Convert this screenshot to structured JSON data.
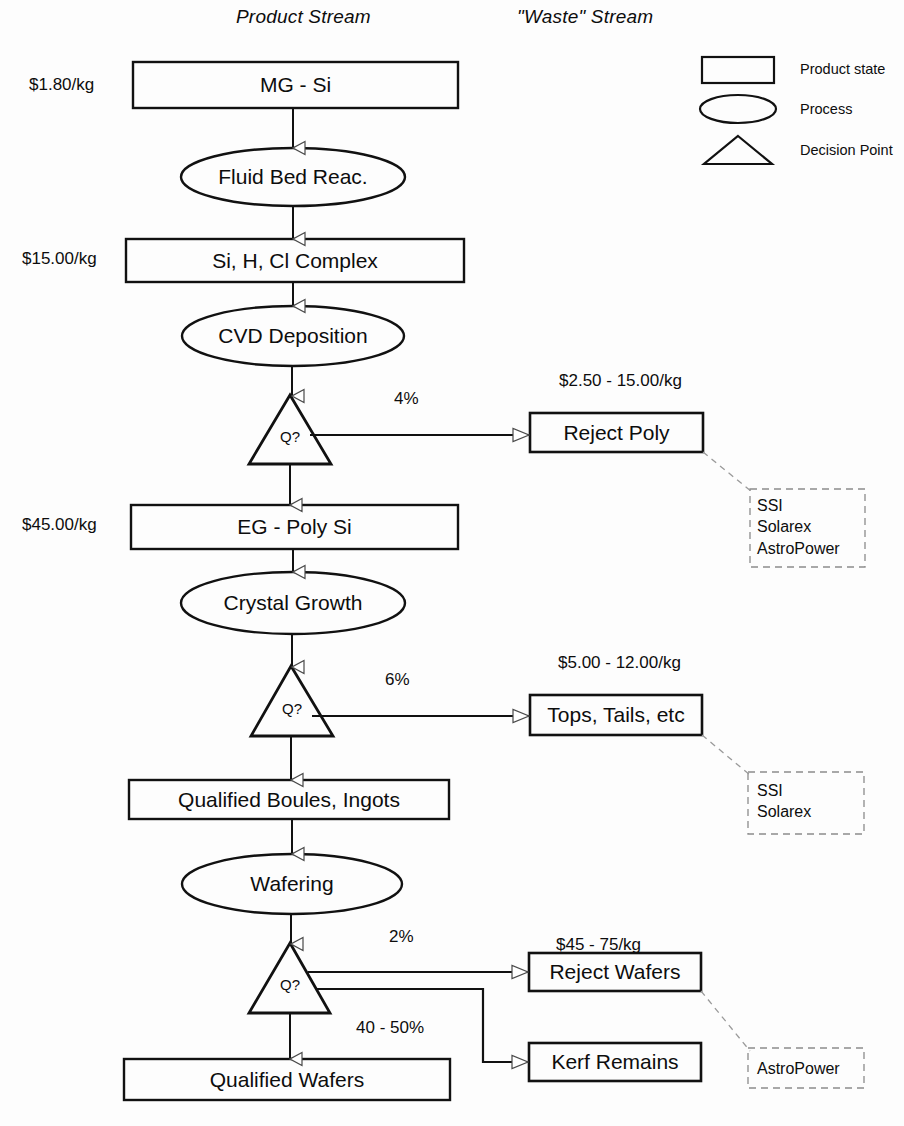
{
  "headers": {
    "product_stream": "Product Stream",
    "waste_stream": "\"Waste\" Stream"
  },
  "legend": {
    "items": [
      {
        "shape": "rectangle",
        "label": "Product state"
      },
      {
        "shape": "ellipse",
        "label": "Process"
      },
      {
        "shape": "triangle",
        "label": "Decision Point"
      }
    ]
  },
  "product_stream": {
    "nodes": [
      {
        "id": "mg-si",
        "type": "product-state",
        "label": "MG - Si",
        "price": "$1.80/kg"
      },
      {
        "id": "fluid-bed-reac",
        "type": "process",
        "label": "Fluid Bed Reac.",
        "price": ""
      },
      {
        "id": "si-h-cl-complex",
        "type": "product-state",
        "label": "Si, H, Cl Complex",
        "price": "$15.00/kg"
      },
      {
        "id": "cvd-deposition",
        "type": "process",
        "label": "CVD Deposition",
        "price": ""
      },
      {
        "id": "decision-1",
        "type": "decision",
        "label": "Q?",
        "price": ""
      },
      {
        "id": "eg-poly-si",
        "type": "product-state",
        "label": "EG -  Poly Si",
        "price": "$45.00/kg"
      },
      {
        "id": "crystal-growth",
        "type": "process",
        "label": "Crystal Growth",
        "price": ""
      },
      {
        "id": "decision-2",
        "type": "decision",
        "label": "Q?",
        "price": ""
      },
      {
        "id": "qualified-boules-ingots",
        "type": "product-state",
        "label": "Qualified Boules, Ingots",
        "price": ""
      },
      {
        "id": "wafering",
        "type": "process",
        "label": "Wafering",
        "price": ""
      },
      {
        "id": "decision-3",
        "type": "decision",
        "label": "Q?",
        "price": ""
      },
      {
        "id": "qualified-wafers",
        "type": "product-state",
        "label": "Qualified Wafers",
        "price": ""
      }
    ]
  },
  "waste_stream": {
    "nodes": [
      {
        "id": "reject-poly",
        "label": "Reject Poly",
        "price": "$2.50 - 15.00/kg",
        "yield_pct": "4%"
      },
      {
        "id": "tops-tails-etc",
        "label": "Tops, Tails, etc",
        "price": "$5.00 - 12.00/kg",
        "yield_pct": "6%"
      },
      {
        "id": "reject-wafers",
        "label": "Reject Wafers",
        "price": "$45 - 75/kg",
        "yield_pct": "2%"
      },
      {
        "id": "kerf-remains",
        "label": "Kerf Remains",
        "price": "",
        "yield_pct": "40 - 50%"
      }
    ]
  },
  "consumers": [
    {
      "id": "consumers-poly",
      "lines": [
        "SSI",
        "Solarex",
        "AstroPower"
      ]
    },
    {
      "id": "consumers-tops",
      "lines": [
        "SSI",
        "Solarex"
      ]
    },
    {
      "id": "consumers-wafers",
      "lines": [
        "AstroPower"
      ]
    }
  ],
  "colors": {
    "stroke": "#111111",
    "dashed_stroke": "#8c8c8c",
    "text": "#0d0d0d",
    "background": "#fdfdfd"
  }
}
